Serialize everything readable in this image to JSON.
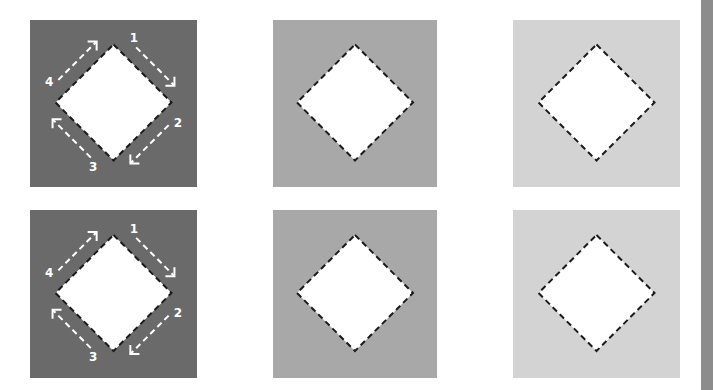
{
  "colors": {
    "background": "#ffffff",
    "dark": "#6a6a6a",
    "medium": "#a8a8a8",
    "light": "#d3d3d3",
    "diamond_fill": "#ffffff",
    "dash_stroke": "#1a1a1a",
    "arrow_stroke": "#ffffff",
    "side_bar": "#8c8c8c"
  },
  "panels": [
    {
      "row": 0,
      "col": 0,
      "shade": "dark",
      "x": 30,
      "y": 20,
      "w": 167,
      "h": 167,
      "show_arrows": true
    },
    {
      "row": 0,
      "col": 1,
      "shade": "medium",
      "x": 273,
      "y": 20,
      "w": 164,
      "h": 167,
      "show_arrows": false
    },
    {
      "row": 0,
      "col": 2,
      "shade": "light",
      "x": 513,
      "y": 20,
      "w": 167,
      "h": 167,
      "show_arrows": false
    },
    {
      "row": 1,
      "col": 0,
      "shade": "dark",
      "x": 30,
      "y": 210,
      "w": 167,
      "h": 168,
      "show_arrows": true
    },
    {
      "row": 1,
      "col": 1,
      "shade": "medium",
      "x": 273,
      "y": 210,
      "w": 164,
      "h": 168,
      "show_arrows": false
    },
    {
      "row": 1,
      "col": 2,
      "shade": "light",
      "x": 513,
      "y": 210,
      "w": 167,
      "h": 168,
      "show_arrows": false
    }
  ],
  "arrow_labels": [
    "1",
    "2",
    "3",
    "4"
  ]
}
